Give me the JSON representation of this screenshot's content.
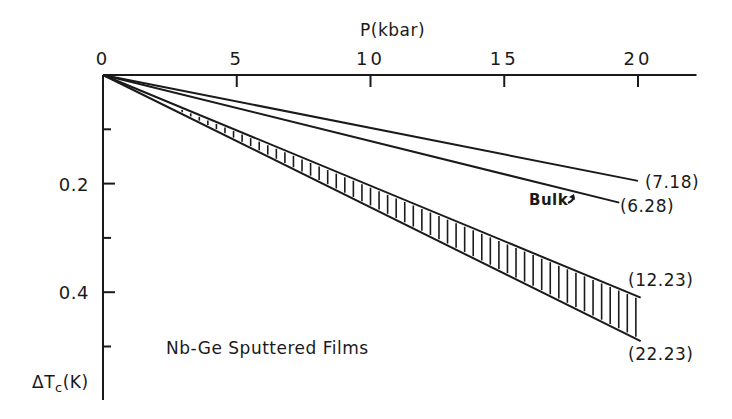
{
  "chart_data": {
    "type": "line",
    "title": "",
    "xlabel": "P(kbar)",
    "ylabel": "ΔTc(K)",
    "ylabel_main": "ΔT",
    "ylabel_sub": "c",
    "ylabel_unit": "(K)",
    "x_axis_position": "top",
    "y_axis_inverted": true,
    "xlim": [
      0,
      22
    ],
    "ylim": [
      0,
      0.55
    ],
    "x_ticks": [
      0,
      5,
      10,
      15,
      20
    ],
    "x_tick_labels": [
      "0",
      "5",
      "10",
      "15",
      "20"
    ],
    "y_ticks_major": [
      0.2,
      0.4
    ],
    "y_tick_labels": [
      "0.2",
      "0.4"
    ],
    "y_ticks_minor": [
      0.1,
      0.3,
      0.5
    ],
    "grid": false,
    "annotation": "Nb-Ge Sputtered Films",
    "series": [
      {
        "name": "(7.18)",
        "x": [
          0,
          20
        ],
        "y": [
          0,
          0.195
        ]
      },
      {
        "name": "(6.28)",
        "label_note": "Bulk",
        "x": [
          0,
          19.3
        ],
        "y": [
          0,
          0.235
        ]
      },
      {
        "name": "(12.23)",
        "x": [
          0,
          20.1
        ],
        "y": [
          0,
          0.41
        ]
      },
      {
        "name": "(22.23)",
        "x": [
          0,
          20.1
        ],
        "y": [
          0,
          0.49
        ]
      }
    ],
    "shaded_region": {
      "between": [
        "(12.23)",
        "(22.23)"
      ],
      "style": "vertical hatching",
      "x_range": [
        2,
        20
      ]
    }
  },
  "labels": {
    "x_axis_title": "P(kbar)",
    "origin": "0",
    "bulk": "Bulk",
    "annotation": "Nb-Ge Sputtered Films",
    "series_718": "(7.18)",
    "series_628": "(6.28)",
    "series_1223": "(12.23)",
    "series_2223": "(22.23)"
  }
}
